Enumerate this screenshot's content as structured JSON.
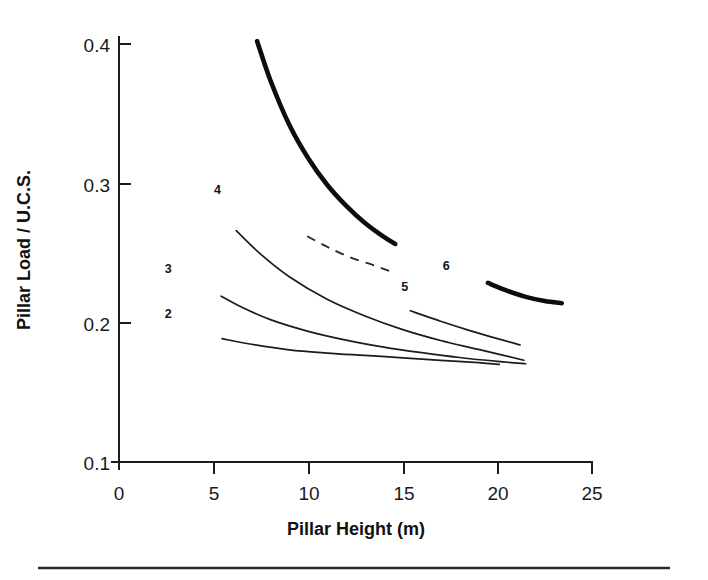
{
  "chart_data": {
    "type": "line",
    "title": "",
    "xlabel": "Pillar Height (m)",
    "ylabel": "Pillar Load / U.C.S.",
    "xlim": [
      0,
      25
    ],
    "ylim": [
      0.1,
      0.4
    ],
    "xticks": [
      0,
      5,
      10,
      15,
      20,
      25
    ],
    "xtick_labels": [
      "0",
      "5",
      "10",
      "15",
      "20",
      "25"
    ],
    "yticks": [
      0.1,
      0.2,
      0.3,
      0.4
    ],
    "ytick_labels": [
      "0.1",
      "0.2",
      "0.3",
      "0.4"
    ],
    "grid": false,
    "legend": "inline-curve-labels",
    "series": [
      {
        "name": "2",
        "label": "2",
        "style": "thin-solid",
        "label_x": 2.6,
        "label_y": 0.2065,
        "points": [
          [
            5.45,
            0.1885
          ],
          [
            7.0,
            0.1845
          ],
          [
            9.0,
            0.1805
          ],
          [
            11.0,
            0.1782
          ],
          [
            13.0,
            0.1765
          ],
          [
            15.0,
            0.1748
          ],
          [
            17.0,
            0.173
          ],
          [
            19.0,
            0.1713
          ],
          [
            20.1,
            0.17
          ]
        ]
      },
      {
        "name": "3",
        "label": "3",
        "style": "thin-solid",
        "label_x": 2.6,
        "label_y": 0.2385,
        "points": [
          [
            5.4,
            0.219
          ],
          [
            6.5,
            0.211
          ],
          [
            8.0,
            0.2022
          ],
          [
            10.0,
            0.1938
          ],
          [
            12.0,
            0.1875
          ],
          [
            14.0,
            0.1825
          ],
          [
            16.0,
            0.1785
          ],
          [
            18.0,
            0.175
          ],
          [
            20.0,
            0.1722
          ],
          [
            21.5,
            0.1705
          ]
        ]
      },
      {
        "name": "4",
        "label": "4",
        "style": "thin-solid",
        "label_x": 5.2,
        "label_y": 0.295,
        "points": [
          [
            6.2,
            0.266
          ],
          [
            7.5,
            0.249
          ],
          [
            9.0,
            0.233
          ],
          [
            11.0,
            0.2168
          ],
          [
            13.0,
            0.2048
          ],
          [
            15.0,
            0.195
          ],
          [
            17.0,
            0.1872
          ],
          [
            19.0,
            0.1808
          ],
          [
            21.4,
            0.173
          ]
        ]
      },
      {
        "name": "5",
        "label": "5",
        "style": "dashed",
        "label_x": 15.1,
        "label_y": 0.2255,
        "points": [
          [
            9.95,
            0.262
          ],
          [
            11.0,
            0.2545
          ],
          [
            12.2,
            0.247
          ],
          [
            13.5,
            0.241
          ],
          [
            14.4,
            0.2365
          ]
        ]
      },
      {
        "name": "5b",
        "label": "",
        "style": "thin-solid",
        "label_x": null,
        "label_y": null,
        "points": [
          [
            15.4,
            0.2085
          ],
          [
            17.0,
            0.201
          ],
          [
            18.5,
            0.1945
          ],
          [
            20.0,
            0.1885
          ],
          [
            21.2,
            0.184
          ]
        ]
      },
      {
        "name": "6",
        "label": "6",
        "style": "thick-solid",
        "label_x": 17.3,
        "label_y": 0.241,
        "points": [
          [
            7.3,
            0.402
          ],
          [
            8.0,
            0.374
          ],
          [
            9.0,
            0.342
          ],
          [
            10.0,
            0.318
          ],
          [
            11.0,
            0.299
          ],
          [
            12.0,
            0.284
          ],
          [
            13.0,
            0.2715
          ],
          [
            14.0,
            0.2615
          ],
          [
            14.6,
            0.2565
          ]
        ]
      },
      {
        "name": "6b",
        "label": "",
        "style": "thick-solid",
        "label_x": null,
        "label_y": null,
        "points": [
          [
            19.5,
            0.2285
          ],
          [
            20.5,
            0.223
          ],
          [
            21.5,
            0.2185
          ],
          [
            22.5,
            0.2155
          ],
          [
            23.4,
            0.214
          ]
        ]
      }
    ],
    "annotations": [
      {
        "text": "2",
        "x": 2.6,
        "y": 0.2065
      },
      {
        "text": "3",
        "x": 2.6,
        "y": 0.2385
      },
      {
        "text": "4",
        "x": 5.2,
        "y": 0.295
      },
      {
        "text": "5",
        "x": 15.1,
        "y": 0.2255
      },
      {
        "text": "6",
        "x": 17.3,
        "y": 0.241
      }
    ]
  },
  "figure": {
    "x_axis_title": "Pillar Height (m)",
    "y_axis_title": "Pillar Load / U.C.S.",
    "ytick_0": "0.4",
    "ytick_1": "0.3",
    "ytick_2": "0.2",
    "ytick_3": "0.1",
    "xtick_0": "0",
    "xtick_1": "5",
    "xtick_2": "10",
    "xtick_3": "15",
    "xtick_4": "20",
    "xtick_5": "25",
    "label_2": "2",
    "label_3": "3",
    "label_4": "4",
    "label_5": "5",
    "label_6": "6"
  }
}
